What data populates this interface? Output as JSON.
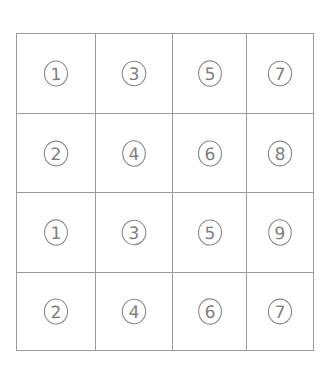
{
  "document": {
    "title": "Hand-drawn 4x4 grid of circled numbers",
    "background_color": "#ffffff",
    "ink_color": "#7e7e7e",
    "grid_line_color": "#9b9b9b",
    "shade_color": "#e6e6e6"
  },
  "grid": {
    "rows": 4,
    "columns": 4,
    "cells": [
      [
        {
          "label": "1",
          "circled": true,
          "shaded": false
        },
        {
          "label": "3",
          "circled": true,
          "shaded": false
        },
        {
          "label": "5",
          "circled": true,
          "shaded": false
        },
        {
          "label": "7",
          "circled": true,
          "shaded": false
        }
      ],
      [
        {
          "label": "2",
          "circled": true,
          "shaded": false
        },
        {
          "label": "4",
          "circled": true,
          "shaded": false
        },
        {
          "label": "6",
          "circled": true,
          "shaded": false
        },
        {
          "label": "8",
          "circled": true,
          "shaded": false
        }
      ],
      [
        {
          "label": "1",
          "circled": true,
          "shaded": true
        },
        {
          "label": "3",
          "circled": true,
          "shaded": true
        },
        {
          "label": "5",
          "circled": true,
          "shaded": true
        },
        {
          "label": "9",
          "circled": true,
          "shaded": false
        }
      ],
      [
        {
          "label": "2",
          "circled": true,
          "shaded": true
        },
        {
          "label": "4",
          "circled": true,
          "shaded": true
        },
        {
          "label": "6",
          "circled": true,
          "shaded": true
        },
        {
          "label": "7",
          "circled": true,
          "shaded": true
        }
      ]
    ]
  }
}
